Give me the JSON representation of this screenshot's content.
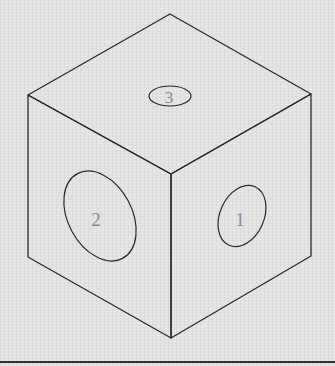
{
  "diagram": {
    "type": "isometric-cube",
    "faces": [
      {
        "name": "right",
        "hole_label": "1"
      },
      {
        "name": "left",
        "hole_label": "2"
      },
      {
        "name": "top",
        "hole_label": "3"
      }
    ],
    "colors": {
      "background": "#e2e2e2",
      "line": "#2a2a2a",
      "label": "#8a8a8a",
      "rule": "#333333"
    }
  }
}
